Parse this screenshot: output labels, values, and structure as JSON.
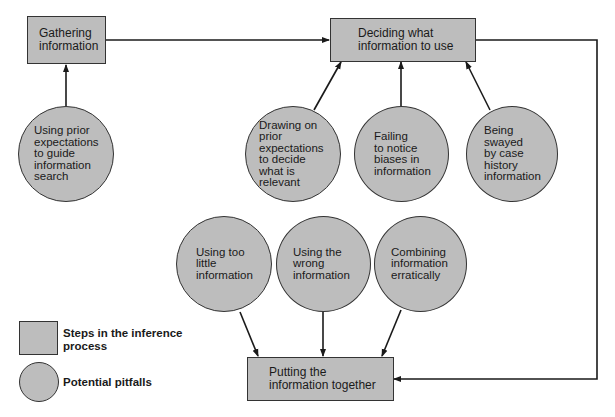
{
  "diagram": {
    "steps": [
      {
        "id": "gathering",
        "label": "Gathering\ninformation"
      },
      {
        "id": "deciding",
        "label": "Deciding what\ninformation to use"
      },
      {
        "id": "putting",
        "label": "Putting the\ninformation together"
      }
    ],
    "pitfalls": [
      {
        "id": "prior-expectations-search",
        "label": "Using prior\nexpectations\nto guide\ninformation\nsearch",
        "target": "gathering"
      },
      {
        "id": "prior-expectations-relevant",
        "label": "Drawing on\nprior\nexpectations\nto decide\nwhat is\nrelevant",
        "target": "deciding"
      },
      {
        "id": "failing-biases",
        "label": "Failing\nto notice\nbiases in\ninformation",
        "target": "deciding"
      },
      {
        "id": "case-history",
        "label": "Being\nswayed\nby case\nhistory\ninformation",
        "target": "deciding"
      },
      {
        "id": "too-little",
        "label": "Using too\nlittle\ninformation",
        "target": "putting"
      },
      {
        "id": "wrong-info",
        "label": "Using the\nwrong\ninformation",
        "target": "putting"
      },
      {
        "id": "erratic",
        "label": "Combining\ninformation\nerratically",
        "target": "putting"
      }
    ],
    "flow": [
      {
        "from": "gathering",
        "to": "deciding"
      },
      {
        "from": "deciding",
        "to": "putting"
      }
    ]
  },
  "legend": {
    "steps_label": "Steps in the inference\nprocess",
    "pitfalls_label": "Potential pitfalls"
  },
  "colors": {
    "fill": "#bdbdbd",
    "stroke": "#333333",
    "background": "#ffffff"
  }
}
